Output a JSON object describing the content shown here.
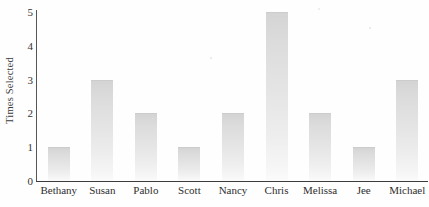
{
  "chart_data": {
    "type": "bar",
    "title": "",
    "xlabel": "",
    "ylabel": "Times Selected",
    "categories": [
      "Bethany",
      "Susan",
      "Pablo",
      "Scott",
      "Nancy",
      "Chris",
      "Melissa",
      "Jee",
      "Michael"
    ],
    "values": [
      1,
      3,
      2,
      1,
      2,
      5,
      2,
      1,
      3
    ],
    "ytick_labels": [
      "0",
      "1",
      "2",
      "3",
      "4",
      "5"
    ],
    "ytick_values": [
      0,
      1,
      2,
      3,
      4,
      5
    ],
    "ylim": [
      0,
      5
    ],
    "grid": false,
    "legend": null,
    "bar_color": "#dcdcdc",
    "axis_color": "#3c3c3c",
    "text_color": "#2e2e2e",
    "background": "#fefefe"
  }
}
